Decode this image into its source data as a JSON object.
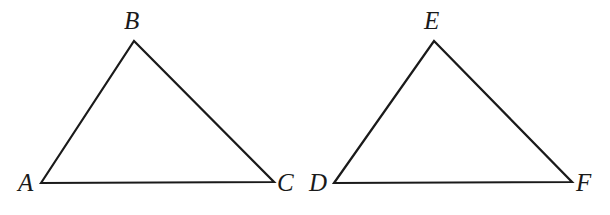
{
  "figure": {
    "kind": "geometry-diagram",
    "background_color": "#ffffff",
    "stroke_color": "#1a1a1a",
    "stroke_width": 2.2,
    "label_color": "#1a1a1a",
    "canvas": {
      "width": 610,
      "height": 215
    }
  },
  "shapes": [
    {
      "name": "triangle-abc",
      "points": "41,183 134,41 274,182",
      "vertices": [
        {
          "id": "A",
          "label": "A",
          "x": 41,
          "y": 183,
          "label_x": 18,
          "label_y": 170
        },
        {
          "id": "B",
          "label": "B",
          "x": 134,
          "y": 41,
          "label_x": 124,
          "label_y": 8
        },
        {
          "id": "C",
          "label": "C",
          "x": 274,
          "y": 182,
          "label_x": 277,
          "label_y": 170
        }
      ]
    },
    {
      "name": "triangle-def",
      "points": "334,183 434,41 572,182",
      "vertices": [
        {
          "id": "D",
          "label": "D",
          "x": 334,
          "y": 183,
          "label_x": 309,
          "label_y": 170
        },
        {
          "id": "E",
          "label": "E",
          "x": 434,
          "y": 41,
          "label_x": 424,
          "label_y": 8
        },
        {
          "id": "F",
          "label": "F",
          "x": 572,
          "y": 182,
          "label_x": 576,
          "label_y": 170
        }
      ]
    }
  ]
}
